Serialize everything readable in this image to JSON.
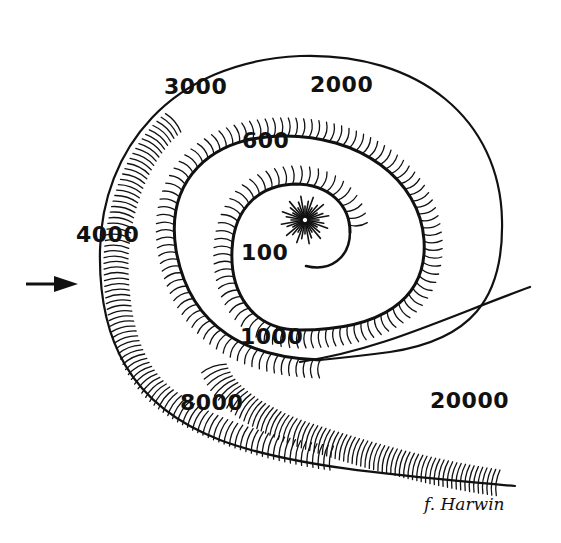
{
  "diagram": {
    "colors": {
      "ink": "#111111",
      "background": "#ffffff"
    },
    "frequency_labels": [
      {
        "id": "f100",
        "text": "100",
        "x": 241,
        "y": 242
      },
      {
        "id": "f600",
        "text": "600",
        "x": 242,
        "y": 130
      },
      {
        "id": "f1000",
        "text": "1000",
        "x": 240,
        "y": 326
      },
      {
        "id": "f2000",
        "text": "2000",
        "x": 310,
        "y": 74
      },
      {
        "id": "f3000",
        "text": "3000",
        "x": 164,
        "y": 76
      },
      {
        "id": "f4000",
        "text": "4000",
        "x": 76,
        "y": 224
      },
      {
        "id": "f8000",
        "text": "8000",
        "x": 180,
        "y": 392
      },
      {
        "id": "f20000",
        "text": "20000",
        "x": 430,
        "y": 390
      }
    ],
    "arrow": {
      "direction": "right",
      "icon": "arrow-right-icon"
    },
    "signature": "f. Harwin"
  }
}
